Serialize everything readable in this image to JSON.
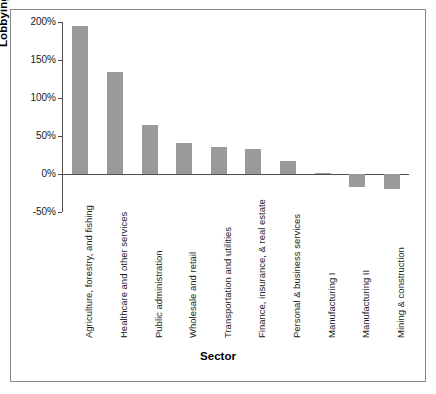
{
  "chart_data": {
    "type": "bar",
    "title": "",
    "xlabel": "Sector",
    "ylabel": "Lobbying Percent Change",
    "categories": [
      "Agriculture, forestry, and fishing",
      "Healthcare and other services",
      "Public administration",
      "Wholesale and retail",
      "Transportation and utilities",
      "Finance, insurance, & real estate",
      "Personal & business services",
      "Manufacturing I",
      "Manufacturing II",
      "Mining & construction"
    ],
    "values": [
      195,
      134,
      65,
      41,
      36,
      33,
      17,
      1,
      -17,
      -20
    ],
    "value_labels": [
      "195%",
      "134%",
      "65%",
      "41%",
      "36%",
      "33%",
      "17%",
      "1%",
      "-17%",
      "-20%"
    ],
    "ylim": [
      -50,
      200
    ],
    "ytick_values": [
      200,
      150,
      100,
      50,
      0,
      -50
    ],
    "ytick_labels": [
      "200%",
      "150%",
      "100%",
      "50%",
      "0%",
      "-50%"
    ],
    "grid": false,
    "legend": false,
    "bar_color": "#9a9a9a",
    "axis_color": "#4d4d4d",
    "frame_color": "#8a8a8a",
    "text_color": "#1a1a1a"
  }
}
